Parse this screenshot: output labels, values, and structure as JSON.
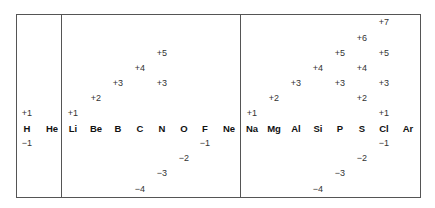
{
  "elements": [
    {
      "symbol": "H",
      "states": [
        "+1",
        "−1"
      ]
    },
    {
      "symbol": "He",
      "states": []
    },
    {
      "symbol": "Li",
      "states": [
        "+1"
      ]
    },
    {
      "symbol": "Be",
      "states": [
        "+2"
      ]
    },
    {
      "symbol": "B",
      "states": [
        "+3"
      ]
    },
    {
      "symbol": "C",
      "states": [
        "+4",
        "−4"
      ]
    },
    {
      "symbol": "N",
      "states": [
        "+5",
        "+3",
        "−3"
      ]
    },
    {
      "symbol": "O",
      "states": [
        "−2"
      ]
    },
    {
      "symbol": "F",
      "states": [
        "−1"
      ]
    },
    {
      "symbol": "Ne",
      "states": []
    },
    {
      "symbol": "Na",
      "states": [
        "+1"
      ]
    },
    {
      "symbol": "Mg",
      "states": [
        "+2"
      ]
    },
    {
      "symbol": "Al",
      "states": [
        "+3"
      ]
    },
    {
      "symbol": "Si",
      "states": [
        "+4",
        "−4"
      ]
    },
    {
      "symbol": "P",
      "states": [
        "+5",
        "+3",
        "−3"
      ]
    },
    {
      "symbol": "S",
      "states": [
        "+6",
        "+4",
        "+2",
        "−2"
      ]
    },
    {
      "symbol": "Cl",
      "states": [
        "+7",
        "+5",
        "+3",
        "+1",
        "−1"
      ]
    },
    {
      "symbol": "Ar",
      "states": []
    }
  ],
  "labels": {
    "H": "H",
    "He": "He",
    "Li": "Li",
    "Be": "Be",
    "B": "B",
    "C": "C",
    "N": "N",
    "O": "O",
    "F": "F",
    "Ne": "Ne",
    "Na": "Na",
    "Mg": "Mg",
    "Al": "Al",
    "Si": "Si",
    "P": "P",
    "S": "S",
    "Cl": "Cl",
    "Ar": "Ar",
    "H_p1": "+1",
    "H_m1": "−1",
    "Li_p1": "+1",
    "Be_p2": "+2",
    "B_p3": "+3",
    "C_p4": "+4",
    "C_m4": "−4",
    "N_p5": "+5",
    "N_p3": "+3",
    "N_m3": "−3",
    "O_m2": "−2",
    "F_m1": "−1",
    "Na_p1": "+1",
    "Mg_p2": "+2",
    "Al_p3": "+3",
    "Si_p4": "+4",
    "Si_m4": "−4",
    "P_p5": "+5",
    "P_p3": "+3",
    "P_m3": "−3",
    "S_p6": "+6",
    "S_p4": "+4",
    "S_p2": "+2",
    "S_m2": "−2",
    "Cl_p7": "+7",
    "Cl_p5": "+5",
    "Cl_p3": "+3",
    "Cl_p1": "+1",
    "Cl_m1": "−1"
  }
}
